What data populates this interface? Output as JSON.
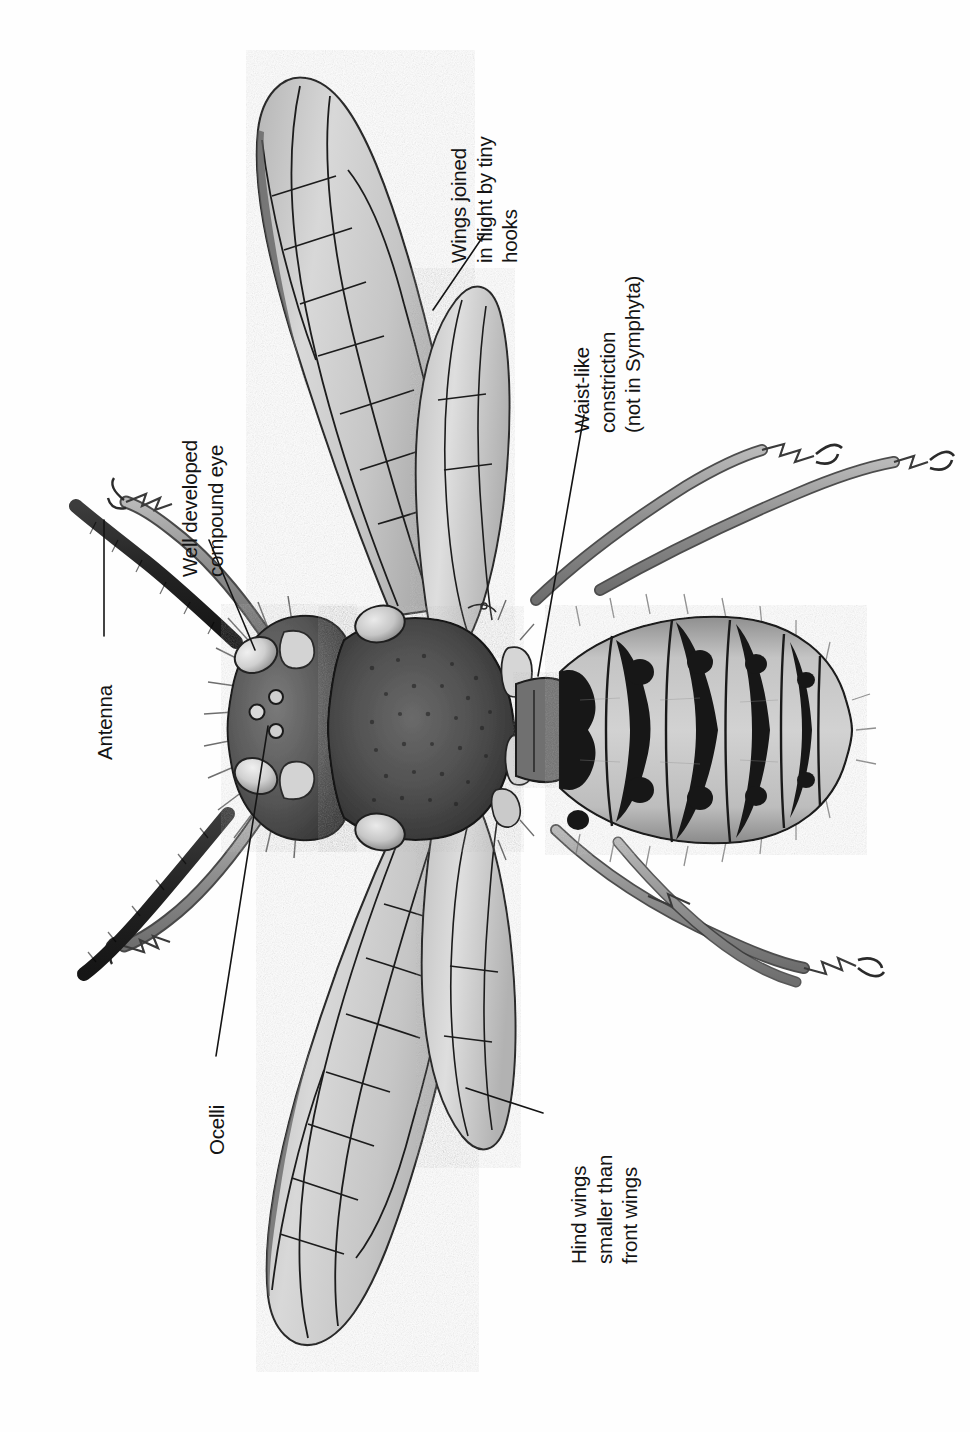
{
  "figure": {
    "orientation": "rotated 90 degrees; labels read bottom-to-top",
    "background_color": "#ffffff",
    "ink_color": "#141414"
  },
  "labels": [
    {
      "id": "wings-joined",
      "name": "wings-joined-by-hooks",
      "lines": [
        "Wings joined",
        "in flight by tiny",
        "hooks"
      ]
    },
    {
      "id": "compound-eye",
      "name": "well-developed-compound-eye",
      "lines": [
        "Well developed",
        "compound eye"
      ]
    },
    {
      "id": "waist",
      "name": "waist-like-constriction",
      "lines": [
        "Waist-like",
        "constriction",
        "(not in Symphyta)"
      ]
    },
    {
      "id": "antenna",
      "name": "antenna",
      "lines": [
        "Antenna"
      ]
    },
    {
      "id": "ocelli",
      "name": "ocelli",
      "lines": [
        "Ocelli"
      ]
    },
    {
      "id": "hind-wings",
      "name": "hind-wings-smaller",
      "lines": [
        "Hind wings",
        "smaller than",
        "front wings"
      ]
    }
  ],
  "anatomy_parts": [
    "antenna-upper",
    "antenna-lower",
    "compound-eye-upper",
    "compound-eye-lower",
    "ocelli-cluster",
    "head",
    "thorax",
    "tegula-upper",
    "tegula-lower",
    "petiole-waist",
    "abdomen",
    "forewing-upper",
    "hindwing-upper",
    "forewing-lower",
    "hindwing-lower",
    "leg-fore-left",
    "leg-mid-left",
    "leg-hind-left",
    "leg-fore-right",
    "leg-mid-right",
    "leg-hind-right"
  ],
  "colors": {
    "ink": "#141414",
    "wing_membrane": "#cfcfcf",
    "wing_shadow": "#a9a9a9",
    "body_light": "#c9c9c9",
    "body_mid": "#8d8d8d",
    "body_dark": "#3a3a3a",
    "thorax_dark": "#4b4b4b",
    "antenna_dark": "#2b2b2b",
    "leg_gray": "#9b9b9b",
    "paper": "#ffffff"
  }
}
